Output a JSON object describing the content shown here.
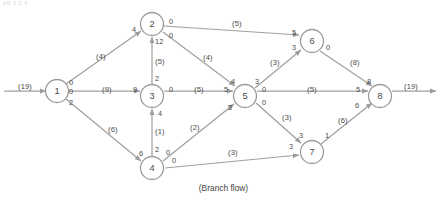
{
  "figure": {
    "caption": "(Branch flow)",
    "top_artifact": "AD 6 S 4",
    "node_stroke": "#9a9a9a",
    "edge_color": "#a0a0a0",
    "text_color": "#4a4a4a"
  },
  "nodes": [
    {
      "id": "1",
      "x": 57,
      "y": 91
    },
    {
      "id": "2",
      "x": 152,
      "y": 24
    },
    {
      "id": "3",
      "x": 152,
      "y": 96
    },
    {
      "id": "4",
      "x": 152,
      "y": 168
    },
    {
      "id": "5",
      "x": 245,
      "y": 96
    },
    {
      "id": "6",
      "x": 312,
      "y": 41
    },
    {
      "id": "7",
      "x": 312,
      "y": 152
    },
    {
      "id": "8",
      "x": 380,
      "y": 96
    }
  ],
  "external": {
    "source_label": "(19)",
    "sink_label": "(19)"
  },
  "edges": [
    {
      "from": "1",
      "to": "2",
      "capacity": "(4)",
      "tail_flow": "0",
      "head_flow": "4"
    },
    {
      "from": "1",
      "to": "3",
      "capacity": "(9)",
      "tail_flow": "0",
      "head_flow": "9"
    },
    {
      "from": "1",
      "to": "4",
      "capacity": "(6)",
      "tail_flow": "2",
      "head_flow": "6"
    },
    {
      "from": "2",
      "to": "6",
      "capacity": "(5)",
      "tail_flow": "0",
      "head_flow": "5"
    },
    {
      "from": "2",
      "to": "5",
      "capacity": "(4)",
      "tail_flow": "0",
      "head_flow": "4"
    },
    {
      "from": "3",
      "to": "2",
      "capacity": "(5)",
      "tail_flow": "2",
      "head_flow": "12"
    },
    {
      "from": "3",
      "to": "5",
      "capacity": "(5)",
      "tail_flow": "0",
      "head_flow": "5"
    },
    {
      "from": "4",
      "to": "3",
      "capacity": "(1)",
      "tail_flow": "2",
      "head_flow": "4"
    },
    {
      "from": "4",
      "to": "5",
      "capacity": "(2)",
      "tail_flow": "0",
      "head_flow": "2"
    },
    {
      "from": "4",
      "to": "7",
      "capacity": "(3)",
      "tail_flow": "0",
      "head_flow": "3"
    },
    {
      "from": "5",
      "to": "6",
      "capacity": "(3)",
      "tail_flow": "3",
      "head_flow": "3"
    },
    {
      "from": "5",
      "to": "8",
      "capacity": "(5)",
      "tail_flow": "0",
      "head_flow": "5"
    },
    {
      "from": "5",
      "to": "7",
      "capacity": "(3)",
      "tail_flow": "0",
      "head_flow": "3"
    },
    {
      "from": "6",
      "to": "8",
      "capacity": "(8)",
      "tail_flow": "0",
      "head_flow": "8"
    },
    {
      "from": "7",
      "to": "8",
      "capacity": "(6)",
      "tail_flow": "1",
      "head_flow": "6"
    }
  ],
  "labels": [
    {
      "name": "source-arc-capacity",
      "text": "(19)",
      "x": 18,
      "y": 83
    },
    {
      "name": "sink-arc-capacity",
      "text": "(19)",
      "x": 404,
      "y": 83
    },
    {
      "name": "flow-1-2-tail",
      "text": "0",
      "x": 69,
      "y": 79
    },
    {
      "name": "flow-1-3-tail",
      "text": "0",
      "x": 69,
      "y": 88
    },
    {
      "name": "flow-1-4-tail",
      "text": "2",
      "x": 69,
      "y": 99
    },
    {
      "name": "cap-1-2",
      "text": "(4)",
      "x": 96,
      "y": 53
    },
    {
      "name": "cap-1-3",
      "text": "(9)",
      "x": 102,
      "y": 86
    },
    {
      "name": "cap-1-4",
      "text": "(6)",
      "x": 108,
      "y": 126
    },
    {
      "name": "flow-1-2-head",
      "text": "4",
      "x": 132,
      "y": 26
    },
    {
      "name": "flow-1-3-head",
      "text": "9",
      "x": 133,
      "y": 86
    },
    {
      "name": "flow-1-4-head",
      "text": "6",
      "x": 139,
      "y": 150
    },
    {
      "name": "flow-2-6-tail",
      "text": "0",
      "x": 169,
      "y": 18
    },
    {
      "name": "flow-2-5-tail",
      "text": "0",
      "x": 169,
      "y": 32
    },
    {
      "name": "cap-2-6",
      "text": "(5)",
      "x": 232,
      "y": 20
    },
    {
      "name": "cap-2-5",
      "text": "(4)",
      "x": 203,
      "y": 54
    },
    {
      "name": "flow-2-6-head",
      "text": "5",
      "x": 292,
      "y": 29
    },
    {
      "name": "flow-2-5-head",
      "text": "4",
      "x": 231,
      "y": 78
    },
    {
      "name": "flow-3-2-head",
      "text": "12",
      "x": 155,
      "y": 38
    },
    {
      "name": "cap-3-2",
      "text": "(5)",
      "x": 155,
      "y": 58
    },
    {
      "name": "flow-3-2-tail",
      "text": "2",
      "x": 155,
      "y": 75
    },
    {
      "name": "flow-3-5-tail",
      "text": "0",
      "x": 169,
      "y": 86
    },
    {
      "name": "cap-3-5",
      "text": "(5)",
      "x": 194,
      "y": 86
    },
    {
      "name": "flow-3-5-head",
      "text": "5",
      "x": 224,
      "y": 86
    },
    {
      "name": "flow-4-3-head",
      "text": "4",
      "x": 158,
      "y": 110
    },
    {
      "name": "cap-4-3",
      "text": "(1)",
      "x": 155,
      "y": 128
    },
    {
      "name": "flow-4-3-tail",
      "text": "2",
      "x": 155,
      "y": 146
    },
    {
      "name": "flow-4-5-tail",
      "text": "0",
      "x": 166,
      "y": 149
    },
    {
      "name": "cap-4-5",
      "text": "(2)",
      "x": 190,
      "y": 124
    },
    {
      "name": "flow-4-5-head",
      "text": "2",
      "x": 228,
      "y": 104
    },
    {
      "name": "flow-4-7-tail",
      "text": "0",
      "x": 172,
      "y": 157
    },
    {
      "name": "cap-4-7",
      "text": "(3)",
      "x": 228,
      "y": 149
    },
    {
      "name": "flow-4-7-head",
      "text": "3",
      "x": 289,
      "y": 143
    },
    {
      "name": "flow-5-6-tail",
      "text": "3",
      "x": 255,
      "y": 78
    },
    {
      "name": "cap-5-6",
      "text": "(3)",
      "x": 270,
      "y": 59
    },
    {
      "name": "flow-5-6-head",
      "text": "3",
      "x": 292,
      "y": 44
    },
    {
      "name": "flow-5-8-tail",
      "text": "0",
      "x": 262,
      "y": 86
    },
    {
      "name": "cap-5-8",
      "text": "(5)",
      "x": 307,
      "y": 86
    },
    {
      "name": "flow-5-8-head",
      "text": "5",
      "x": 356,
      "y": 86
    },
    {
      "name": "flow-5-7-tail",
      "text": "0",
      "x": 262,
      "y": 99
    },
    {
      "name": "cap-5-7",
      "text": "(3)",
      "x": 282,
      "y": 114
    },
    {
      "name": "flow-5-7-head",
      "text": "3",
      "x": 299,
      "y": 132
    },
    {
      "name": "flow-6-8-tail",
      "text": "0",
      "x": 326,
      "y": 44
    },
    {
      "name": "cap-6-8",
      "text": "(8)",
      "x": 350,
      "y": 59
    },
    {
      "name": "flow-6-8-head",
      "text": "8",
      "x": 367,
      "y": 78
    },
    {
      "name": "flow-7-8-tail",
      "text": "1",
      "x": 325,
      "y": 132
    },
    {
      "name": "cap-7-8",
      "text": "(6)",
      "x": 338,
      "y": 117
    },
    {
      "name": "flow-7-8-head",
      "text": "6",
      "x": 355,
      "y": 102
    }
  ]
}
